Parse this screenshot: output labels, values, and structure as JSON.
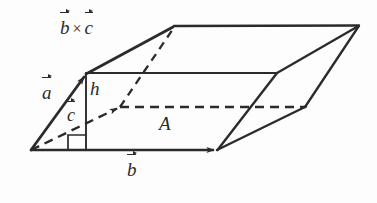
{
  "figure": {
    "background_color": "#fdfdfd",
    "ink_color": "#2b2b2b",
    "width": 377,
    "height": 203,
    "labels": {
      "cross_product": {
        "first": "b",
        "operator": "×",
        "second": "c"
      },
      "vector_a": "a",
      "vector_c": "c",
      "height": "h",
      "area": "A",
      "vector_b": "b"
    },
    "geometry": {
      "origin": [
        31,
        150
      ],
      "b_tip": [
        217,
        150
      ],
      "a_tip": [
        86,
        75
      ],
      "c_tip": [
        120,
        107
      ],
      "top_back_left": [
        175,
        26
      ],
      "top_back_right": [
        358,
        26
      ],
      "mid_right": [
        277,
        73
      ],
      "hidden_right": [
        305,
        107
      ],
      "far_bottom_right": [
        330,
        126
      ]
    },
    "elements": [
      {
        "name": "vector-a-arrow",
        "kind": "solid-arrow",
        "from": [
          31,
          150
        ],
        "to": [
          86,
          75
        ]
      },
      {
        "name": "vector-b-arrow",
        "kind": "solid-arrow",
        "from": [
          31,
          150
        ],
        "to": [
          217,
          150
        ]
      },
      {
        "name": "vector-c-arrow",
        "kind": "dashed-arrow",
        "from": [
          31,
          150
        ],
        "to": [
          120,
          107
        ]
      },
      {
        "name": "cross-product-arrow",
        "kind": "solid-arrow",
        "from": [
          86,
          75
        ],
        "to": [
          175,
          26
        ]
      },
      {
        "name": "height-segment",
        "kind": "solid",
        "from": [
          86,
          75
        ],
        "to": [
          86,
          150
        ]
      },
      {
        "name": "right-angle-marker",
        "kind": "square",
        "at": [
          68,
          135
        ],
        "size": 15
      },
      {
        "name": "top-face-back-edge",
        "kind": "solid",
        "from": [
          175,
          26
        ],
        "to": [
          358,
          26
        ]
      },
      {
        "name": "top-face-front-edge",
        "kind": "solid",
        "from": [
          86,
          73
        ],
        "to": [
          277,
          73
        ]
      },
      {
        "name": "top-face-right-edge",
        "kind": "solid",
        "from": [
          277,
          73
        ],
        "to": [
          358,
          26
        ]
      },
      {
        "name": "hidden-vertical-diagonal",
        "kind": "dashed",
        "from": [
          120,
          107
        ],
        "to": [
          175,
          26
        ]
      },
      {
        "name": "hidden-base-edge",
        "kind": "dashed",
        "from": [
          120,
          107
        ],
        "to": [
          305,
          107
        ]
      },
      {
        "name": "hidden-right-edge",
        "kind": "dashed-join",
        "from": [
          305,
          107
        ],
        "to": [
          358,
          26
        ]
      },
      {
        "name": "base-right-edge",
        "kind": "solid",
        "from": [
          217,
          150
        ],
        "to": [
          305,
          107
        ]
      },
      {
        "name": "base-far-edge",
        "kind": "solid",
        "from": [
          217,
          150
        ],
        "to": [
          358,
          26
        ]
      },
      {
        "name": "front-right-face-edge",
        "kind": "solid",
        "from": [
          217,
          150
        ],
        "to": [
          277,
          73
        ]
      }
    ]
  }
}
